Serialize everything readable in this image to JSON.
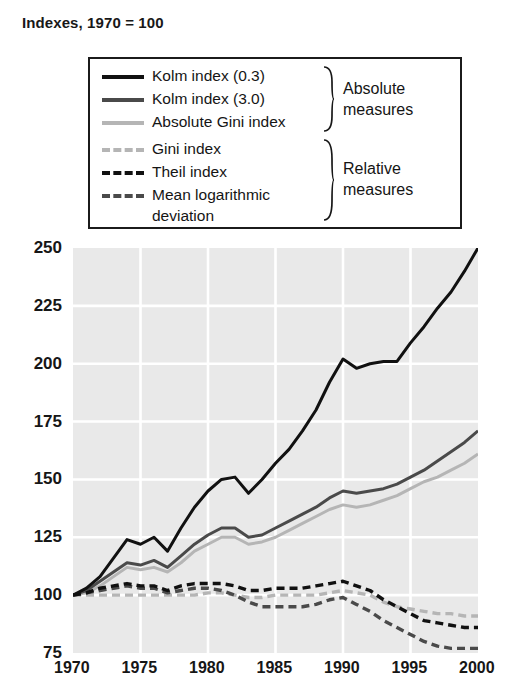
{
  "title": "Indexes, 1970 = 100",
  "axes": {
    "y_ticks": [
      "250",
      "225",
      "200",
      "175",
      "150",
      "125",
      "100",
      "75"
    ],
    "x_ticks": [
      "1970",
      "1975",
      "1980",
      "1985",
      "1990",
      "1995",
      "2000"
    ]
  },
  "legend": {
    "entries": [
      {
        "label": "Kolm index (0.3)",
        "style": "solid",
        "color": "#111111"
      },
      {
        "label": "Kolm index (3.0)",
        "style": "solid",
        "color": "#4a4a4a"
      },
      {
        "label": "Absolute Gini index",
        "style": "solid",
        "color": "#b5b5b5"
      },
      {
        "label": "Gini index",
        "style": "dashed",
        "color": "#b5b5b5"
      },
      {
        "label": "Theil index",
        "style": "dashed",
        "color": "#111111"
      },
      {
        "label": "Mean logarithmic",
        "style": "dashed",
        "color": "#4a4a4a"
      }
    ],
    "continuation_label": "deviation",
    "group_absolute_line1": "Absolute",
    "group_absolute_line2": "measures",
    "group_relative_line1": "Relative",
    "group_relative_line2": "measures"
  },
  "chart_data": {
    "type": "line",
    "title": "Indexes, 1970 = 100",
    "xlabel": "",
    "ylabel": "Indexes, 1970 = 100",
    "xlim": [
      1970,
      2000
    ],
    "ylim": [
      75,
      250
    ],
    "y_ticks": [
      75,
      100,
      125,
      150,
      175,
      200,
      225,
      250
    ],
    "x_ticks": [
      1970,
      1975,
      1980,
      1985,
      1990,
      1995,
      2000
    ],
    "grid": true,
    "legend_position": "top-center-inset",
    "x": [
      1970,
      1971,
      1972,
      1973,
      1974,
      1975,
      1976,
      1977,
      1978,
      1979,
      1980,
      1981,
      1982,
      1983,
      1984,
      1985,
      1986,
      1987,
      1988,
      1989,
      1990,
      1991,
      1992,
      1993,
      1994,
      1995,
      1996,
      1997,
      1998,
      1999,
      2000
    ],
    "series": [
      {
        "name": "Kolm index (0.3)",
        "group": "Absolute measures",
        "style": "solid",
        "color": "#111111",
        "values": [
          100,
          103,
          108,
          116,
          124,
          122,
          125,
          119,
          129,
          138,
          145,
          150,
          151,
          144,
          150,
          157,
          163,
          171,
          180,
          192,
          202,
          198,
          200,
          201,
          201,
          209,
          216,
          224,
          231,
          240,
          250
        ]
      },
      {
        "name": "Kolm index (3.0)",
        "group": "Absolute measures",
        "style": "solid",
        "color": "#4a4a4a",
        "values": [
          100,
          102,
          106,
          110,
          114,
          113,
          115,
          112,
          117,
          122,
          126,
          129,
          129,
          125,
          126,
          129,
          132,
          135,
          138,
          142,
          145,
          144,
          145,
          146,
          148,
          151,
          154,
          158,
          162,
          166,
          171
        ]
      },
      {
        "name": "Absolute Gini index",
        "group": "Absolute measures",
        "style": "solid",
        "color": "#b5b5b5",
        "values": [
          100,
          101,
          104,
          108,
          112,
          111,
          112,
          110,
          114,
          119,
          122,
          125,
          125,
          122,
          123,
          125,
          128,
          131,
          134,
          137,
          139,
          138,
          139,
          141,
          143,
          146,
          149,
          151,
          154,
          157,
          161
        ]
      },
      {
        "name": "Gini index",
        "group": "Relative measures",
        "style": "dashed",
        "color": "#b5b5b5",
        "values": [
          100,
          100,
          100,
          100,
          100,
          100,
          100,
          100,
          100,
          100,
          101,
          101,
          100,
          99,
          99,
          100,
          100,
          100,
          100,
          101,
          102,
          101,
          100,
          97,
          95,
          94,
          93,
          92,
          92,
          91,
          91
        ]
      },
      {
        "name": "Theil index",
        "group": "Relative measures",
        "style": "dashed",
        "color": "#111111",
        "values": [
          100,
          101,
          103,
          104,
          105,
          104,
          104,
          102,
          104,
          105,
          105,
          105,
          104,
          102,
          102,
          103,
          103,
          103,
          104,
          105,
          106,
          104,
          102,
          98,
          95,
          92,
          89,
          88,
          87,
          86,
          86
        ]
      },
      {
        "name": "Mean logarithmic deviation",
        "group": "Relative measures",
        "style": "dashed",
        "color": "#4a4a4a",
        "values": [
          100,
          101,
          102,
          103,
          104,
          103,
          103,
          101,
          102,
          103,
          103,
          102,
          100,
          97,
          95,
          95,
          95,
          95,
          96,
          98,
          99,
          96,
          93,
          89,
          86,
          83,
          80,
          78,
          77,
          77,
          77
        ]
      }
    ]
  }
}
